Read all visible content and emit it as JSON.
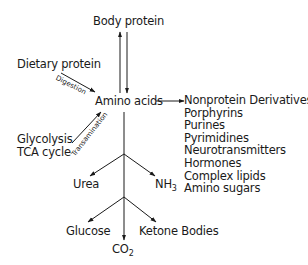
{
  "diagram": {
    "type": "metabolic-flow",
    "nodes": {
      "body_protein": "Body protein",
      "dietary_protein": "Dietary protein",
      "amino_acids": "Amino acids",
      "glycolysis": "Glycolysis",
      "tca_cycle": "TCA cycle",
      "urea": "Urea",
      "nh3_base": "NH",
      "nh3_sub": "3",
      "glucose": "Glucose",
      "co2_base": "CO",
      "co2_sub": "2",
      "ketone_bodies": "Ketone Bodies"
    },
    "edge_labels": {
      "digestion": "Digestion",
      "transamination": "Transamination"
    },
    "nonprotein_derivatives": [
      "Nonprotein Derivatives",
      "Porphyrins",
      "Purines",
      "Pyrimidines",
      "Neurotransmitters",
      "Hormones",
      "Complex lipids",
      "Amino sugars"
    ],
    "edges": [
      {
        "from": "Amino acids",
        "to": "Body protein"
      },
      {
        "from": "Body protein",
        "to": "Amino acids"
      },
      {
        "from": "Dietary protein",
        "to": "Amino acids",
        "label": "Digestion"
      },
      {
        "from": "Glycolysis / TCA cycle",
        "to": "Amino acids",
        "label": "Transamination"
      },
      {
        "from": "Amino acids",
        "to": "Nonprotein Derivatives"
      },
      {
        "from": "Amino acids",
        "to": "Urea"
      },
      {
        "from": "Amino acids",
        "to": "NH3"
      },
      {
        "from": "Amino acids",
        "to": "Glucose"
      },
      {
        "from": "Amino acids",
        "to": "CO2"
      },
      {
        "from": "Amino acids",
        "to": "Ketone Bodies"
      }
    ],
    "colors": {
      "ink": "#1a1a1a",
      "background": "#ffffff"
    }
  }
}
